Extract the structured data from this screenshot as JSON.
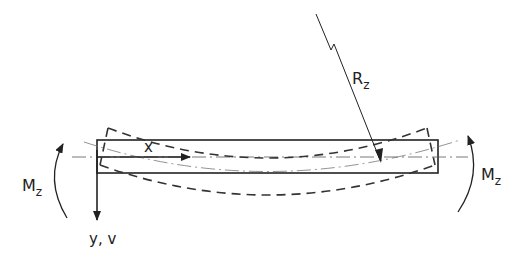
{
  "diagram": {
    "labels": {
      "moment_left": "M",
      "moment_left_sub": "z",
      "moment_right": "M",
      "moment_right_sub": "z",
      "radius": "R",
      "radius_sub": "z",
      "x_axis": "x",
      "y_axis": "y, v"
    },
    "colors": {
      "ink": "#222222",
      "background": "#ffffff"
    }
  }
}
